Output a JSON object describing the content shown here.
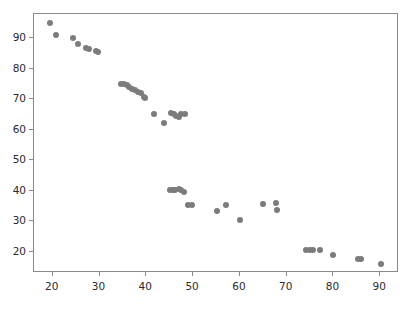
{
  "chart_data": {
    "type": "scatter",
    "title": "",
    "subtitle": "",
    "xlabel": "",
    "ylabel": "",
    "xlim": [
      16,
      94
    ],
    "ylim": [
      13,
      98
    ],
    "xticks": [
      20,
      30,
      40,
      50,
      60,
      70,
      80,
      90
    ],
    "yticks": [
      20,
      30,
      40,
      50,
      60,
      70,
      80,
      90
    ],
    "xtick_labels": [
      "20",
      "30",
      "40",
      "50",
      "60",
      "70",
      "80",
      "90"
    ],
    "ytick_labels": [
      "20",
      "30",
      "40",
      "50",
      "60",
      "70",
      "80",
      "90"
    ],
    "grid": false,
    "legend": null,
    "legend_position": "none",
    "marker_color": "#7c7c7c",
    "marker_size": 6,
    "axis_color": "#8a8a8a",
    "background_color": "#ffffff",
    "series": [
      {
        "name": "points",
        "points": [
          [
            19.5,
            95.2
          ],
          [
            20.6,
            91.0
          ],
          [
            24.4,
            90.0
          ],
          [
            25.3,
            88.1
          ],
          [
            27.2,
            86.7
          ],
          [
            27.7,
            86.5
          ],
          [
            29.2,
            86.0
          ],
          [
            29.6,
            85.5
          ],
          [
            34.6,
            75.0
          ],
          [
            35.2,
            74.9
          ],
          [
            35.8,
            74.6
          ],
          [
            36.4,
            74.0
          ],
          [
            37.0,
            73.3
          ],
          [
            37.6,
            73.0
          ],
          [
            38.2,
            72.5
          ],
          [
            38.8,
            72.2
          ],
          [
            39.4,
            70.8
          ],
          [
            39.8,
            70.5
          ],
          [
            41.7,
            65.3
          ],
          [
            43.8,
            62.1
          ],
          [
            45.3,
            65.5
          ],
          [
            45.9,
            65.3
          ],
          [
            46.4,
            64.5
          ],
          [
            46.9,
            64.3
          ],
          [
            47.5,
            65.3
          ],
          [
            48.2,
            65.3
          ],
          [
            45.0,
            40.3
          ],
          [
            45.6,
            40.4
          ],
          [
            46.2,
            40.3
          ],
          [
            46.9,
            40.6
          ],
          [
            47.4,
            40.2
          ],
          [
            48.0,
            39.5
          ],
          [
            49.0,
            35.4
          ],
          [
            49.7,
            35.3
          ],
          [
            55.0,
            33.2
          ],
          [
            57.0,
            35.4
          ],
          [
            60.0,
            30.4
          ],
          [
            65.0,
            35.5
          ],
          [
            67.8,
            35.9
          ],
          [
            68.0,
            33.7
          ],
          [
            74.2,
            20.6
          ],
          [
            74.9,
            20.6
          ],
          [
            75.6,
            20.5
          ],
          [
            77.1,
            20.6
          ],
          [
            80.0,
            18.8
          ],
          [
            85.2,
            17.7
          ],
          [
            85.9,
            17.7
          ],
          [
            90.1,
            15.8
          ]
        ]
      }
    ]
  },
  "figure": {
    "plot_area": {
      "left_px": 33,
      "top_px": 13,
      "width_px": 365,
      "height_px": 259
    }
  }
}
